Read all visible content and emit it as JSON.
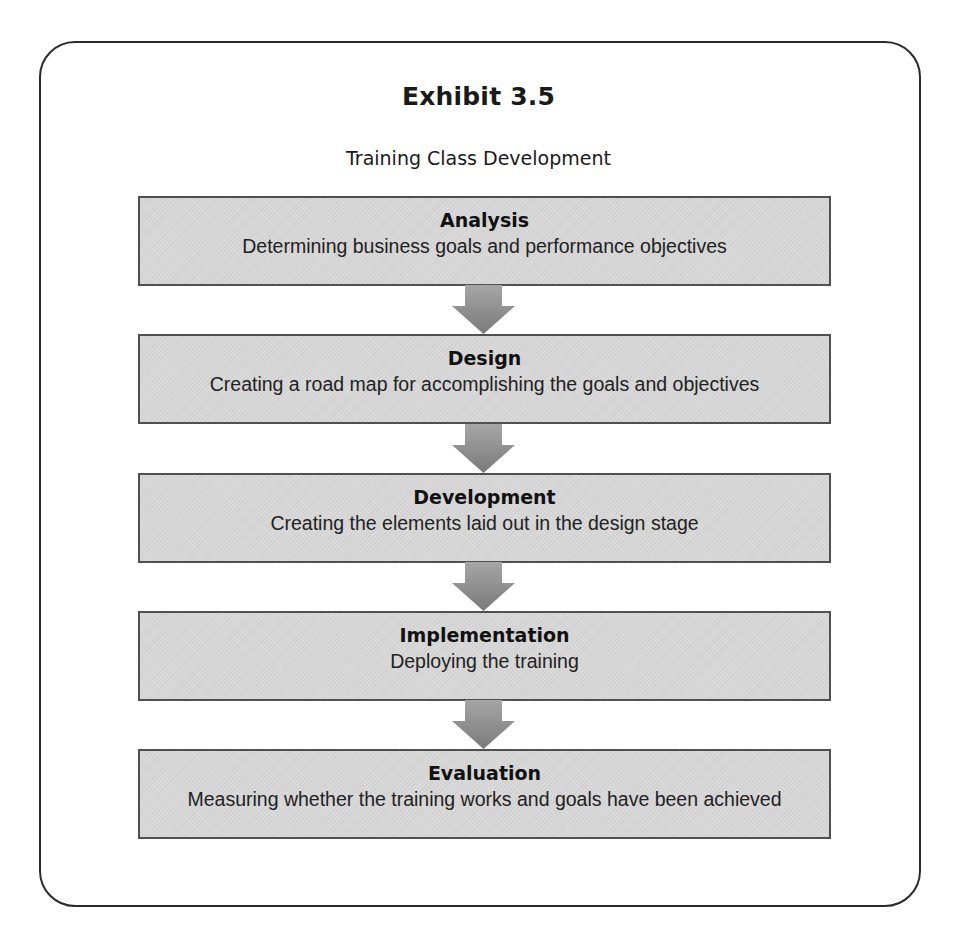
{
  "exhibit": {
    "title": "Exhibit 3.5",
    "subtitle": "Training Class Development"
  },
  "steps": [
    {
      "title": "Analysis",
      "description": "Determining business goals and performance objectives"
    },
    {
      "title": "Design",
      "description": "Creating a road map for accomplishing the goals and objectives"
    },
    {
      "title": "Development",
      "description": "Creating the elements laid out in the design stage"
    },
    {
      "title": "Implementation",
      "description": "Deploying the training"
    },
    {
      "title": "Evaluation",
      "description": "Measuring whether the training works and goals have been achieved"
    }
  ],
  "colors": {
    "box_fill": "#d7d7d7",
    "box_border": "#505050",
    "arrow_fill": "#8c8c8c",
    "frame_border": "#2a2a2a"
  }
}
